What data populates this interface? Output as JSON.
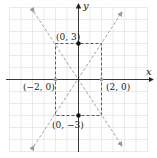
{
  "diagram": {
    "type": "coordinate-plane",
    "axes": {
      "x_label": "x",
      "y_label": "y"
    },
    "grid": {
      "visible": true,
      "color": "#d9d9d9",
      "range": [
        -6,
        6
      ]
    },
    "rectangle": {
      "corners": [
        [
          -2,
          3
        ],
        [
          2,
          3
        ],
        [
          2,
          -3
        ],
        [
          -2,
          -3
        ]
      ],
      "style": "dashed",
      "color": "#333333"
    },
    "asymptotes": [
      {
        "equation": "y = 1.5x",
        "style": "dashed",
        "color": "#9a9a9a"
      },
      {
        "equation": "y = -1.5x",
        "style": "dashed",
        "color": "#9a9a9a"
      }
    ],
    "points": [
      {
        "label": "(0, 3)",
        "x": 0,
        "y": 3,
        "color": "#111111"
      },
      {
        "label": "(0, −3)",
        "x": 0,
        "y": -3,
        "color": "#111111"
      },
      {
        "label": "(−2, 0)",
        "x": -2,
        "y": 0,
        "color": "#999999"
      },
      {
        "label": "(2, 0)",
        "x": 2,
        "y": 0,
        "color": "#999999"
      }
    ]
  }
}
